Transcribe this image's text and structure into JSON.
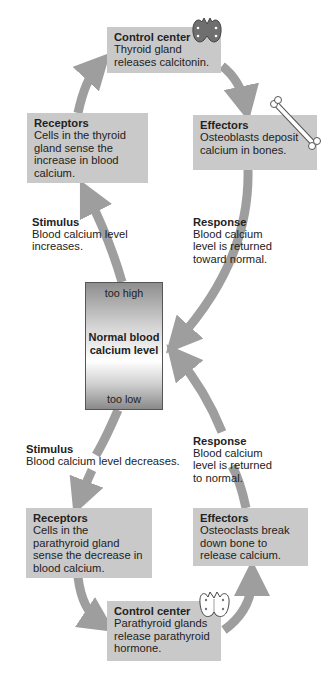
{
  "diagram": {
    "colors": {
      "box_fill": "#c9c9c9",
      "arrow": "#9e9e9e",
      "text": "#222222"
    },
    "upper_loop": {
      "control_center": {
        "title": "Control center",
        "text": "Thyroid gland releases calcitonin.",
        "icon": "thyroid-gland-icon"
      },
      "receptors": {
        "title": "Receptors",
        "text": "Cells in the thyroid gland sense the increase in blood calcium."
      },
      "effectors": {
        "title": "Effectors",
        "text": "Osteoblasts deposit calcium in bones.",
        "icon": "bone-icon"
      },
      "stimulus": {
        "title": "Stimulus",
        "text": "Blood calcium level increases."
      },
      "response": {
        "title": "Response",
        "text": "Blood calcium level is returned toward normal."
      }
    },
    "center": {
      "too_high": "too high",
      "label_line1": "Normal blood",
      "label_line2": "calcium level",
      "too_low": "too low"
    },
    "lower_loop": {
      "stimulus": {
        "title": "Stimulus",
        "text": "Blood calcium level decreases."
      },
      "response": {
        "title": "Response",
        "text": "Blood calcium level is returned to normal."
      },
      "receptors": {
        "title": "Receptors",
        "text": "Cells in the parathyroid gland sense the decrease in blood calcium."
      },
      "effectors": {
        "title": "Effectors",
        "text": "Osteoclasts break down bone to release calcium."
      },
      "control_center": {
        "title": "Control center",
        "text": "Parathyroid glands release parathyroid hormone.",
        "icon": "parathyroid-gland-icon"
      }
    }
  }
}
